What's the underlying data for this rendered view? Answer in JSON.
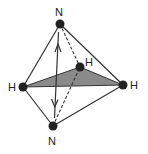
{
  "diagram": {
    "type": "molecular-geometry",
    "colors": {
      "line": "#333333",
      "atom": "#222222",
      "plane_fill": "#8a8a8a",
      "background": "#ffffff"
    },
    "atoms": [
      {
        "id": "N_top",
        "label": "N",
        "x": 60,
        "y": 24
      },
      {
        "id": "N_bottom",
        "label": "N",
        "x": 53,
        "y": 126
      },
      {
        "id": "H_left",
        "label": "H",
        "x": 23,
        "y": 87
      },
      {
        "id": "H_right",
        "label": "H",
        "x": 123,
        "y": 85
      },
      {
        "id": "H_middle",
        "label": "H",
        "x": 80,
        "y": 67
      }
    ],
    "labels": {
      "n_top": "N",
      "n_bottom": "N",
      "h_left": "H",
      "h_right": "H",
      "h_middle": "H"
    },
    "bonds": [
      {
        "from": "N_top",
        "to": "H_left",
        "style": "solid"
      },
      {
        "from": "N_top",
        "to": "H_right",
        "style": "solid"
      },
      {
        "from": "N_top",
        "to": "H_middle",
        "style": "dashed"
      },
      {
        "from": "N_bottom",
        "to": "H_left",
        "style": "solid"
      },
      {
        "from": "N_bottom",
        "to": "H_right",
        "style": "solid"
      },
      {
        "from": "N_bottom",
        "to": "H_middle",
        "style": "dashed"
      }
    ],
    "arrow": {
      "from": "N_top",
      "to": "N_bottom",
      "style": "double-headed"
    }
  }
}
